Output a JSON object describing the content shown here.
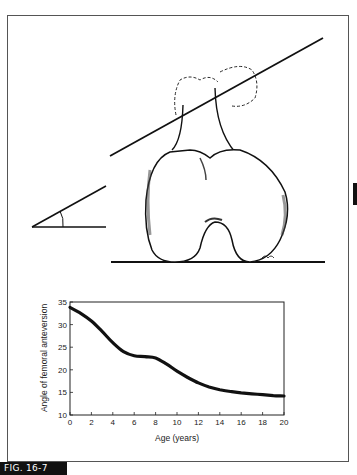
{
  "figure": {
    "label": "FIG. 16-7",
    "illustration": {
      "subject": "distal femur viewed from below showing femoral anteversion angle",
      "elements": [
        "femoral-neck-axis-line",
        "condylar-baseline",
        "angle-diagram",
        "femur-drawing"
      ]
    }
  },
  "chart_data": {
    "type": "line",
    "title": "",
    "xlabel": "Age (years)",
    "ylabel": "Angle of femoral anteversion",
    "xlim": [
      0,
      20
    ],
    "ylim": [
      10,
      35
    ],
    "x_ticks": [
      0,
      2,
      4,
      6,
      8,
      10,
      12,
      14,
      16,
      18,
      20
    ],
    "y_ticks": [
      10,
      15,
      20,
      25,
      30,
      35
    ],
    "grid": false,
    "legend": null,
    "series": [
      {
        "name": "Femoral anteversion",
        "x": [
          0,
          1,
          2,
          3,
          4,
          5,
          6,
          7,
          8,
          9,
          10,
          11,
          12,
          13,
          14,
          15,
          16,
          17,
          18,
          19,
          20
        ],
        "values": [
          33.8,
          32.5,
          30.8,
          28.5,
          26.0,
          24.0,
          23.1,
          22.9,
          22.6,
          21.3,
          19.7,
          18.3,
          17.1,
          16.2,
          15.6,
          15.2,
          14.9,
          14.7,
          14.5,
          14.3,
          14.2
        ]
      }
    ]
  },
  "colors": {
    "line": "#111111",
    "frame": "#555555",
    "label_bg": "#111111",
    "label_fg": "#ffffff"
  }
}
